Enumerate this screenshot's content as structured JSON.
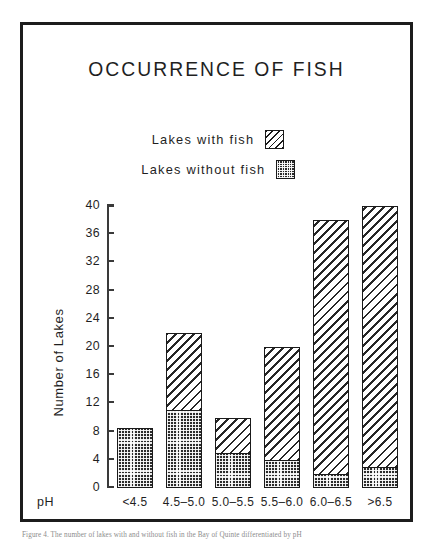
{
  "chart_data": {
    "type": "bar",
    "title": "OCCURRENCE OF FISH",
    "xlabel": "pH",
    "ylabel": "Number of Lakes",
    "categories": [
      "<4.5",
      "4.5–5.0",
      "5.0–5.5",
      "5.5–6.0",
      "6.0–6.5",
      ">6.5"
    ],
    "series": [
      {
        "name": "Lakes without fish",
        "swatch": "dotted-dark",
        "values": [
          8.5,
          11,
          5,
          4,
          2,
          3
        ]
      },
      {
        "name": "Lakes with fish",
        "swatch": "diagonal-hatch",
        "values": [
          0,
          11,
          5,
          16,
          36,
          37
        ]
      }
    ],
    "totals": [
      8.5,
      22,
      10,
      20,
      38,
      40
    ],
    "ylim": [
      0,
      40
    ],
    "yticks": [
      0,
      4,
      8,
      12,
      16,
      20,
      24,
      28,
      32,
      36,
      40
    ],
    "ytick_labels": [
      "0",
      "4",
      "8",
      "12",
      "16",
      "20",
      "24",
      "28",
      "32",
      "36",
      "40"
    ],
    "grid": false,
    "stacked": true,
    "legend_position": "top-center"
  },
  "legend": {
    "items": [
      {
        "label": "Lakes with fish",
        "swatch": "diagonal-hatch"
      },
      {
        "label": "Lakes without fish",
        "swatch": "dotted-dark"
      }
    ]
  },
  "caption": "Figure 4.  The number of lakes with and without fish in the Bay of Quinte differentiated by pH"
}
